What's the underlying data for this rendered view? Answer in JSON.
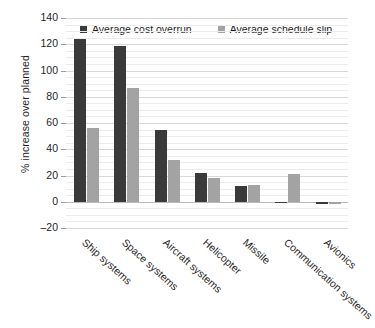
{
  "chart_data": {
    "type": "bar",
    "title": "",
    "xlabel": "",
    "ylabel": "% increase over planned",
    "ylim": [
      -20,
      140
    ],
    "ytick_step": 20,
    "yticks": [
      140,
      120,
      100,
      80,
      60,
      40,
      20,
      0,
      -20
    ],
    "ytick_labels": [
      "140",
      "120",
      "100",
      "80",
      "60",
      "40",
      "20",
      "0",
      "–20"
    ],
    "grid": "horizontal",
    "legend_position": "top",
    "categories": [
      "Ship systems",
      "Space systems",
      "Aircraft systems",
      "Helicopter",
      "Missile",
      "Communication systems",
      "Avionics"
    ],
    "series": [
      {
        "name": "Average cost overrun",
        "color": "#3a3a3a",
        "values": [
          124,
          119,
          55,
          22,
          12,
          0,
          -2
        ]
      },
      {
        "name": "Average schedule slip",
        "color": "#a3a3a3",
        "values": [
          56,
          87,
          32,
          18,
          13,
          21,
          -2
        ]
      }
    ]
  },
  "legend": {
    "items": [
      {
        "label": "Average cost overrun",
        "color": "#3a3a3a"
      },
      {
        "label": "Average schedule slip",
        "color": "#a3a3a3"
      }
    ]
  },
  "axes": {
    "y_title": "% increase over planned"
  },
  "colors": {
    "series_dark": "#3a3a3a",
    "series_light": "#a3a3a3",
    "gridline": "#d8d8d8",
    "zeroline": "#b9b9b9",
    "text": "#1f1f1f",
    "background": "#ffffff"
  }
}
